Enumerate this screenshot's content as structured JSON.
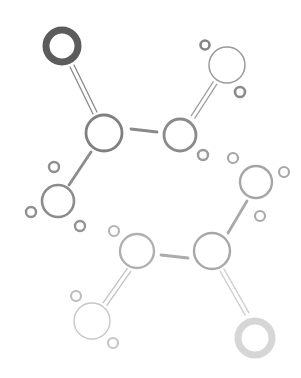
{
  "diagram": {
    "width": 301,
    "height": 378,
    "background": "#ffffff",
    "atoms": [
      {
        "id": "o1",
        "type": "oxygen-heavy",
        "cx": 62,
        "cy": 46,
        "r": 16,
        "stroke": 7,
        "color": "#5c5c5c"
      },
      {
        "id": "c1",
        "type": "carbon",
        "cx": 104,
        "cy": 133,
        "r": 18,
        "stroke": 2.8,
        "color": "#808080"
      },
      {
        "id": "c2",
        "type": "carbon",
        "cx": 180,
        "cy": 135,
        "r": 16,
        "stroke": 2.8,
        "color": "#8a8a8a"
      },
      {
        "id": "o2",
        "type": "oxygen",
        "cx": 227,
        "cy": 65,
        "r": 18,
        "stroke": 1.5,
        "color": "#9a9a9a"
      },
      {
        "id": "c3",
        "type": "carbon",
        "cx": 58,
        "cy": 201,
        "r": 16,
        "stroke": 2.6,
        "color": "#8c8c8c"
      },
      {
        "id": "c4",
        "type": "carbon",
        "cx": 256,
        "cy": 182,
        "r": 16,
        "stroke": 2.4,
        "color": "#a5a5a5"
      },
      {
        "id": "c5",
        "type": "carbon",
        "cx": 212,
        "cy": 251,
        "r": 18,
        "stroke": 2.4,
        "color": "#a8a8a8"
      },
      {
        "id": "c6",
        "type": "carbon",
        "cx": 137,
        "cy": 251,
        "r": 17,
        "stroke": 2.4,
        "color": "#b0b0b0"
      },
      {
        "id": "o3",
        "type": "oxygen",
        "cx": 92,
        "cy": 321,
        "r": 18,
        "stroke": 1.4,
        "color": "#c8c8c8"
      },
      {
        "id": "o4",
        "type": "oxygen-heavy",
        "cx": 255,
        "cy": 338,
        "r": 17,
        "stroke": 7,
        "color": "#d6d6d6"
      }
    ],
    "hydrogens": [
      {
        "id": "h1",
        "cx": 205,
        "cy": 45,
        "r": 4.5,
        "stroke": 2.6,
        "color": "#858585"
      },
      {
        "id": "h2",
        "cx": 240,
        "cy": 92,
        "r": 5,
        "stroke": 2.6,
        "color": "#8a8a8a"
      },
      {
        "id": "h3",
        "cx": 203,
        "cy": 155,
        "r": 5,
        "stroke": 2.4,
        "color": "#9a9a9a"
      },
      {
        "id": "h4",
        "cx": 54,
        "cy": 167,
        "r": 5,
        "stroke": 2.4,
        "color": "#8f8f8f"
      },
      {
        "id": "h5",
        "cx": 31,
        "cy": 212,
        "r": 5,
        "stroke": 2.4,
        "color": "#8f8f8f"
      },
      {
        "id": "h6",
        "cx": 80,
        "cy": 226,
        "r": 5,
        "stroke": 2.4,
        "color": "#949494"
      },
      {
        "id": "h7",
        "cx": 233,
        "cy": 158,
        "r": 5,
        "stroke": 2.2,
        "color": "#a5a5a5"
      },
      {
        "id": "h8",
        "cx": 284,
        "cy": 172,
        "r": 5,
        "stroke": 2.2,
        "color": "#a8a8a8"
      },
      {
        "id": "h9",
        "cx": 260,
        "cy": 216,
        "r": 5,
        "stroke": 2.2,
        "color": "#aaaaaa"
      },
      {
        "id": "h10",
        "cx": 114,
        "cy": 231,
        "r": 5,
        "stroke": 2.2,
        "color": "#b3b3b3"
      },
      {
        "id": "h11",
        "cx": 76,
        "cy": 296,
        "r": 5,
        "stroke": 2.2,
        "color": "#bdbdbd"
      },
      {
        "id": "h12",
        "cx": 113,
        "cy": 343,
        "r": 5,
        "stroke": 2.2,
        "color": "#c6c6c6"
      }
    ],
    "bonds": [
      {
        "id": "b1",
        "order": 2,
        "x1": 72,
        "y1": 66,
        "x2": 95,
        "y2": 113,
        "color": "#8a8a8a"
      },
      {
        "id": "b2",
        "order": 1,
        "x1": 131,
        "y1": 129,
        "x2": 157,
        "y2": 132,
        "color": "#8a8a8a"
      },
      {
        "id": "b3",
        "order": 2,
        "x1": 193,
        "y1": 117,
        "x2": 215,
        "y2": 83,
        "color": "#a0a0a0"
      },
      {
        "id": "b4",
        "order": 1,
        "x1": 91,
        "y1": 152,
        "x2": 69,
        "y2": 185,
        "color": "#8c8c8c"
      },
      {
        "id": "b5",
        "order": 1,
        "x1": 247,
        "y1": 201,
        "x2": 228,
        "y2": 233,
        "color": "#a8a8a8"
      },
      {
        "id": "b6",
        "order": 1,
        "x1": 161,
        "y1": 255,
        "x2": 188,
        "y2": 258,
        "color": "#ababab"
      },
      {
        "id": "b7",
        "order": 2,
        "x1": 129,
        "y1": 270,
        "x2": 105,
        "y2": 304,
        "color": "#c2c2c2"
      },
      {
        "id": "b8",
        "order": 2,
        "x1": 222,
        "y1": 270,
        "x2": 247,
        "y2": 314,
        "color": "#cfcfcf"
      }
    ]
  }
}
